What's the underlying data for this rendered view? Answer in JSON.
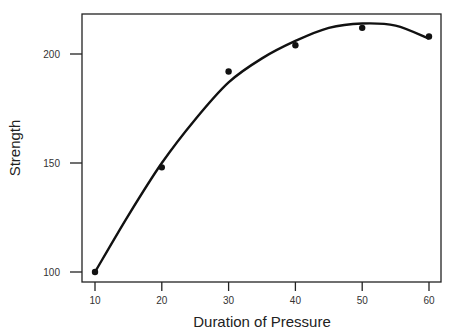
{
  "chart_data": {
    "type": "scatter",
    "title": "",
    "xlabel": "Duration of Pressure",
    "ylabel": "Strength",
    "xlim": [
      8,
      62
    ],
    "ylim": [
      96,
      218
    ],
    "xticks": [
      10,
      20,
      30,
      40,
      50,
      60
    ],
    "yticks": [
      100,
      150,
      200
    ],
    "grid": false,
    "legend": "none",
    "series": [
      {
        "name": "observed",
        "kind": "points",
        "x": [
          10,
          20,
          30,
          40,
          50,
          60
        ],
        "y": [
          100,
          148,
          192,
          204,
          212,
          208
        ]
      },
      {
        "name": "fitted curve",
        "kind": "line",
        "x": [
          10,
          15,
          20,
          25,
          30,
          35,
          40,
          45,
          50,
          55,
          60
        ],
        "y": [
          100,
          126,
          150,
          170,
          187,
          198,
          206,
          212,
          214,
          213,
          207
        ]
      }
    ]
  }
}
